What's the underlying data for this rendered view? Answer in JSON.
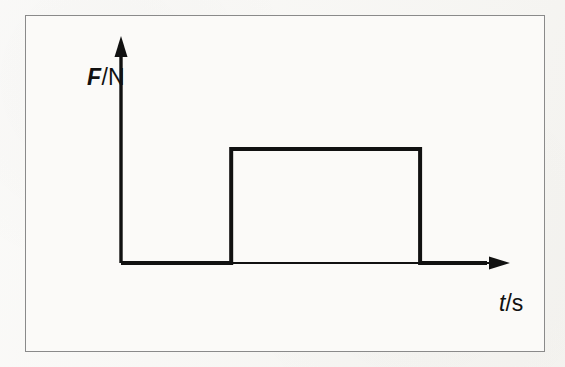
{
  "figure": {
    "kind": "line-chart",
    "caption": "",
    "background_color": "#f7f6f3",
    "panel_color": "#fbfaf8",
    "border_color": "#8a8a8a",
    "ink_color": "#111111"
  },
  "axes": {
    "y": {
      "label_symbol": "F",
      "label_separator": "/",
      "label_unit": "N",
      "label_full": "F/N",
      "arrow": "up-arrow-icon",
      "ticks": [],
      "tick_labels": []
    },
    "x": {
      "label_symbol": "t",
      "label_separator": "/",
      "label_unit": "s",
      "label_full": "t/s",
      "arrow": "right-arrow-icon",
      "ticks": [],
      "tick_labels": []
    }
  },
  "chart_data": {
    "type": "line",
    "title": "",
    "subtitle": "",
    "xlabel": "t/s",
    "ylabel": "F/N",
    "xlim": [
      0,
      10
    ],
    "ylim": [
      0,
      3
    ],
    "grid": false,
    "legend": null,
    "legend_position": "none",
    "annotations": [],
    "series": [
      {
        "name": "Force pulse",
        "style": "step",
        "line_width_px": 4,
        "color": "#111111",
        "x": [
          0,
          2.8,
          2.8,
          7.6,
          7.6,
          9.3
        ],
        "y": [
          0,
          0,
          2,
          2,
          0,
          0
        ],
        "description": "Rectangular force pulse: zero force, a constant raised force between two instants, then zero force again."
      }
    ],
    "pulse": {
      "baseline_value": 0,
      "plateau_value": 2,
      "rise_time": 2.8,
      "fall_time": 7.6,
      "duration": 4.8
    }
  }
}
